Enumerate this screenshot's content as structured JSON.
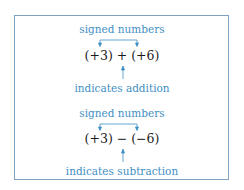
{
  "colors": {
    "accent": "#3f8fc4",
    "border": "#7ea3c2",
    "text": "#1a1a1a"
  },
  "examples": [
    {
      "top_label": "signed numbers",
      "expression": "(+3) + (+6)",
      "bottom_label": "indicates addition"
    },
    {
      "top_label": "signed numbers",
      "expression": "(+3) − (−6)",
      "bottom_label": "indicates subtraction"
    }
  ]
}
